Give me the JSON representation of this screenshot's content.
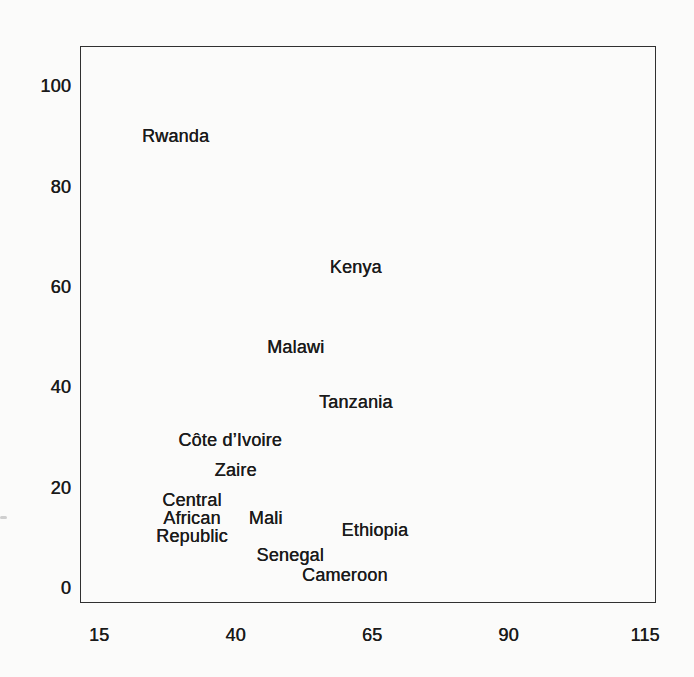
{
  "chart_data": {
    "type": "scatter",
    "title": "",
    "xlabel": "",
    "ylabel": "",
    "xlim": [
      11.5,
      117
    ],
    "ylim": [
      -3,
      108
    ],
    "x_ticks": [
      15,
      40,
      65,
      90,
      115
    ],
    "y_ticks": [
      0,
      20,
      40,
      60,
      80,
      100
    ],
    "grid": false,
    "legend": "none",
    "marker_style": "text-label",
    "points": [
      {
        "label": "Rwanda",
        "x": 29,
        "y": 90
      },
      {
        "label": "Kenya",
        "x": 62,
        "y": 64
      },
      {
        "label": "Malawi",
        "x": 51,
        "y": 48
      },
      {
        "label": "Tanzania",
        "x": 62,
        "y": 37
      },
      {
        "label": "Côte d’Ivoire",
        "x": 39,
        "y": 29.5
      },
      {
        "label": "Zaire",
        "x": 40,
        "y": 23.5
      },
      {
        "label": "Central\nAfrican\nRepublic",
        "x": 32,
        "y": 14
      },
      {
        "label": "Mali",
        "x": 45.5,
        "y": 14
      },
      {
        "label": "Ethiopia",
        "x": 65.5,
        "y": 11.5
      },
      {
        "label": "Senegal",
        "x": 50,
        "y": 6.5
      },
      {
        "label": "Cameroon",
        "x": 60,
        "y": 2.5
      }
    ]
  }
}
